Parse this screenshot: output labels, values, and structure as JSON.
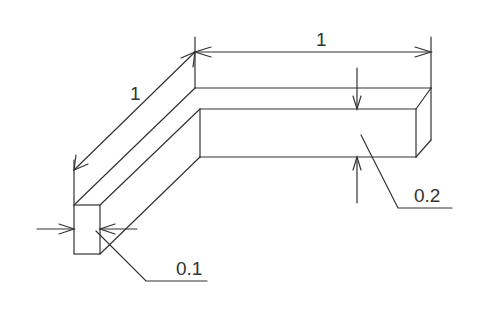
{
  "diagram": {
    "type": "isometric-technical-drawing",
    "stroke_color": "#333333",
    "background": "#ffffff",
    "dimensions": [
      {
        "id": "top-length",
        "label": "1"
      },
      {
        "id": "diagonal-length",
        "label": "1"
      },
      {
        "id": "height",
        "label": "0.2"
      },
      {
        "id": "width",
        "label": "0.1"
      }
    ]
  }
}
